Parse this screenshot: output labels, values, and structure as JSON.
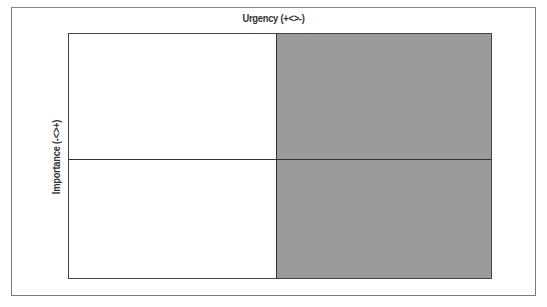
{
  "diagram": {
    "type": "quadrant-matrix",
    "x_axis_label": "Urgency (+<>-)",
    "y_axis_label": "Importance (-<>+)",
    "quadrants": [
      {
        "position": "top-left",
        "color": "#ffffff"
      },
      {
        "position": "top-right",
        "color": "#9b9b9b"
      },
      {
        "position": "bottom-left",
        "color": "#ffffff"
      },
      {
        "position": "bottom-right",
        "color": "#9b9b9b"
      }
    ],
    "colors": {
      "shaded": "#9b9b9b",
      "unshaded": "#ffffff",
      "border": "#444444"
    }
  }
}
